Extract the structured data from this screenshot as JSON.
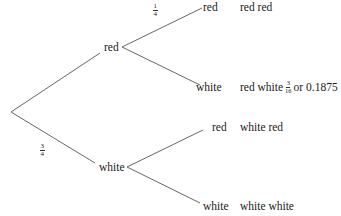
{
  "diagram": {
    "type": "probability-tree",
    "root": {
      "x": 11,
      "y": 112
    },
    "level1": [
      {
        "label": "red",
        "probability": null
      },
      {
        "label": "white",
        "probability": {
          "num": "3",
          "den": "4"
        }
      }
    ],
    "level2": {
      "red": [
        {
          "label": "red",
          "probability": {
            "num": "1",
            "den": "4"
          },
          "outcome": "red red"
        },
        {
          "label": "white",
          "probability": null,
          "outcome": "red white",
          "outcome_prob": {
            "num": "3",
            "den": "16"
          },
          "outcome_suffix": "or 0.1875"
        }
      ],
      "white": [
        {
          "label": "red",
          "probability": null,
          "outcome": "white red"
        },
        {
          "label": "white",
          "probability": null,
          "outcome": "white white"
        }
      ]
    },
    "line_color": "#555555",
    "text_color": "#1a1a1a"
  }
}
